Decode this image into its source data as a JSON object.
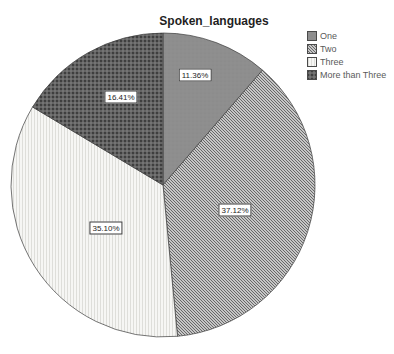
{
  "chart_data": {
    "type": "pie",
    "title": "Spoken_languages",
    "legend_position": "top-right",
    "start_angle_deg": -90,
    "direction": "clockwise",
    "slices": [
      {
        "label": "One",
        "value": 11.36,
        "pct_label": "11.36%",
        "pattern": "solid-gray",
        "color": "#8e8e8e"
      },
      {
        "label": "Two",
        "value": 37.12,
        "pct_label": "37.12%",
        "pattern": "diagonal-hatch",
        "color": "#a4a4a4"
      },
      {
        "label": "Three",
        "value": 35.1,
        "pct_label": "35.10%",
        "pattern": "light-vertical",
        "color": "#f2f2f0"
      },
      {
        "label": "More than Three",
        "value": 16.41,
        "pct_label": "16.41%",
        "pattern": "dark-dots",
        "color": "#5c5c5c"
      }
    ],
    "outline_color": "#3c3c3c",
    "background_color": "#ffffff"
  }
}
